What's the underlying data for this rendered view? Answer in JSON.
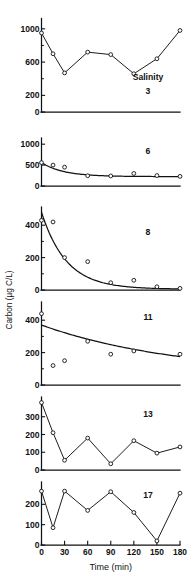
{
  "figure": {
    "ylabel": "Carbon (µg C/L)",
    "xlabel": "Time (min)",
    "salinity_prefix": "Salinity"
  },
  "chart_data": {
    "type": "line",
    "title": "",
    "xlabel": "Time (min)",
    "ylabel": "Carbon (µg C/L)",
    "xlim": [
      0,
      180
    ],
    "xticks": [
      0,
      30,
      60,
      90,
      120,
      150,
      180
    ],
    "xticklabels": [
      "0",
      "30",
      "60",
      "90",
      "120",
      "150",
      "180"
    ],
    "grid": false,
    "legend": "none",
    "panel_annotation": "Salinity value shown at right of each panel",
    "panels": [
      {
        "salinity": "3",
        "annotation_label": "Salinity",
        "annotation_value": "3",
        "ylim": [
          0,
          1100
        ],
        "yticks": [
          0,
          200,
          600,
          1000
        ],
        "yticklabels": [
          "0",
          "200",
          "600",
          "1000"
        ],
        "minor_yticks": [
          400,
          800
        ],
        "has_fit_curve": false,
        "x": [
          0,
          15,
          30,
          60,
          90,
          120,
          150,
          180
        ],
        "values": [
          950,
          700,
          470,
          720,
          690,
          460,
          640,
          980
        ]
      },
      {
        "salinity": "6",
        "annotation_label": "",
        "annotation_value": "6",
        "ylim": [
          0,
          1100
        ],
        "yticks": [
          0,
          500,
          1000
        ],
        "yticklabels": [
          "0",
          "500",
          "1000"
        ],
        "minor_yticks": [],
        "has_fit_curve": true,
        "fit": {
          "y0": 560,
          "yinf": 225,
          "k": 0.035
        },
        "x": [
          0,
          15,
          30,
          60,
          90,
          120,
          150,
          180
        ],
        "values": [
          560,
          500,
          450,
          245,
          240,
          300,
          250,
          230
        ]
      },
      {
        "salinity": "8",
        "annotation_label": "",
        "annotation_value": "8",
        "ylim": [
          0,
          500
        ],
        "yticks": [
          0,
          200,
          400
        ],
        "yticklabels": [
          "0",
          "200",
          "400"
        ],
        "minor_yticks": [
          100,
          300
        ],
        "has_fit_curve": true,
        "fit": {
          "y0": 480,
          "yinf": 5,
          "k": 0.031
        },
        "x": [
          0,
          15,
          30,
          60,
          90,
          120,
          150,
          180
        ],
        "values": [
          430,
          420,
          200,
          175,
          45,
          60,
          20,
          10
        ]
      },
      {
        "salinity": "11",
        "annotation_label": "",
        "annotation_value": "11",
        "ylim": [
          0,
          500
        ],
        "yticks": [
          0,
          200,
          400
        ],
        "yticklabels": [
          "0",
          "200",
          "400"
        ],
        "minor_yticks": [
          100,
          300
        ],
        "has_fit_curve": true,
        "fit": {
          "y0": 370,
          "yinf": 60,
          "k": 0.0055
        },
        "x": [
          0,
          15,
          30,
          60,
          90,
          120,
          180
        ],
        "values": [
          440,
          120,
          150,
          270,
          190,
          210,
          190
        ]
      },
      {
        "salinity": "13",
        "annotation_label": "",
        "annotation_value": "13",
        "ylim": [
          0,
          400
        ],
        "yticks": [
          0,
          100,
          200,
          300
        ],
        "yticklabels": [
          "0",
          "100",
          "200",
          "300"
        ],
        "minor_yticks": [],
        "has_fit_curve": false,
        "x": [
          0,
          15,
          30,
          60,
          90,
          120,
          150,
          180
        ],
        "values": [
          380,
          210,
          55,
          180,
          35,
          165,
          95,
          130
        ]
      },
      {
        "salinity": "17",
        "annotation_label": "",
        "annotation_value": "17",
        "ylim": [
          0,
          300
        ],
        "yticks": [
          0,
          100,
          200
        ],
        "yticklabels": [
          "0",
          "100",
          "200"
        ],
        "minor_yticks": [],
        "has_fit_curve": false,
        "x": [
          0,
          15,
          30,
          60,
          90,
          120,
          150,
          180
        ],
        "values": [
          265,
          85,
          265,
          170,
          262,
          160,
          20,
          255
        ]
      }
    ]
  }
}
